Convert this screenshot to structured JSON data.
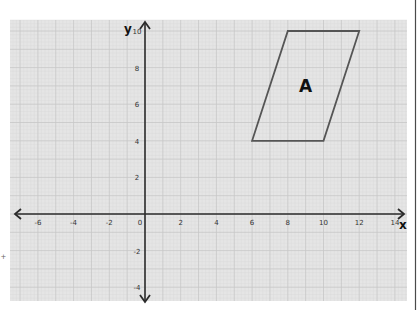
{
  "chart_data": {
    "type": "scatter",
    "title": "",
    "xlabel": "x",
    "ylabel": "y",
    "xlim": [
      -7,
      14
    ],
    "ylim": [
      -4,
      10
    ],
    "grid": true,
    "x_ticks": [
      -6,
      -4,
      -2,
      0,
      2,
      4,
      6,
      8,
      10,
      12,
      14
    ],
    "y_ticks": [
      -4,
      -2,
      2,
      4,
      6,
      8,
      10
    ],
    "shapes": [
      {
        "name": "A",
        "kind": "parallelogram",
        "vertices": [
          [
            8,
            10
          ],
          [
            12,
            10
          ],
          [
            10,
            4
          ],
          [
            6,
            4
          ]
        ],
        "label_position": [
          9,
          7
        ]
      }
    ],
    "annotations": [
      "A"
    ]
  },
  "colors": {
    "grid_background": "#e5e5e5",
    "grid_major": "#c6c6c6",
    "grid_minor": "#d9d9d9",
    "axis": "#2b2b2b",
    "shape_stroke": "#555555",
    "label": "#111111"
  },
  "labels": {
    "x_axis": "x",
    "y_axis": "y",
    "shape_label": "A",
    "stray_mark": "+"
  }
}
